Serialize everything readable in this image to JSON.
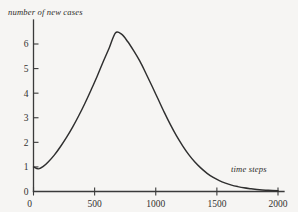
{
  "figure": {
    "background_color": "#f6f5f3",
    "line_color": "#2f2f2f",
    "axis_color": "#3a3a3a",
    "y_axis_title": "number of new cases",
    "x_axis_title": "time steps"
  },
  "chart_data": {
    "type": "line",
    "title": "",
    "xlabel": "time steps",
    "ylabel": "number of new cases",
    "xlim": [
      0,
      2050
    ],
    "ylim": [
      0,
      7.0
    ],
    "grid": false,
    "legend": null,
    "xticks": [
      0,
      500,
      1000,
      1500,
      2000
    ],
    "xtick_labels": [
      "0",
      "500",
      "1000",
      "1500",
      "2000"
    ],
    "yticks": [
      0,
      1,
      2,
      3,
      4,
      5,
      6
    ],
    "ytick_labels": [
      "0",
      "1",
      "2",
      "3",
      "4",
      "5",
      "6"
    ],
    "annotations": [
      "curve begins at roughly (0, 1) then dips slightly before rising",
      "single unimodal peak of about 6.5 near time step 670",
      "long right tail approaching 0 past time step 1700"
    ],
    "series": [
      {
        "name": "new cases",
        "x": [
          0,
          40,
          80,
          120,
          170,
          220,
          270,
          320,
          370,
          420,
          470,
          520,
          570,
          620,
          670,
          720,
          770,
          820,
          870,
          920,
          970,
          1020,
          1070,
          1120,
          1170,
          1220,
          1270,
          1320,
          1370,
          1420,
          1470,
          1520,
          1570,
          1620,
          1670,
          1720,
          1780,
          1850,
          1920,
          2000
        ],
        "y": [
          1.0,
          0.92,
          1.02,
          1.2,
          1.48,
          1.82,
          2.2,
          2.62,
          3.08,
          3.58,
          4.12,
          4.68,
          5.28,
          5.85,
          6.45,
          6.4,
          6.1,
          5.72,
          5.3,
          4.8,
          4.28,
          3.75,
          3.22,
          2.72,
          2.26,
          1.86,
          1.5,
          1.2,
          0.95,
          0.74,
          0.57,
          0.44,
          0.34,
          0.26,
          0.2,
          0.15,
          0.11,
          0.07,
          0.05,
          0.03
        ]
      }
    ]
  }
}
